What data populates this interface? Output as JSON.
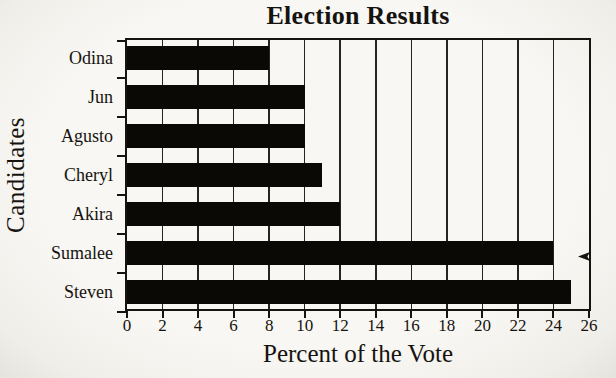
{
  "chart_data": {
    "type": "bar",
    "orientation": "horizontal",
    "title": "Election Results",
    "xlabel": "Percent of the Vote",
    "ylabel": "Candidates",
    "categories": [
      "Odina",
      "Jun",
      "Agusto",
      "Cheryl",
      "Akira",
      "Sumalee",
      "Steven"
    ],
    "values": [
      8,
      10,
      10,
      11,
      12,
      24,
      25
    ],
    "xlim": [
      0,
      26
    ],
    "xticks": [
      0,
      2,
      4,
      6,
      8,
      10,
      12,
      14,
      16,
      18,
      20,
      22,
      24,
      26
    ],
    "grid": "vertical gridlines every 2 units",
    "legend": "none",
    "bar_color": "#0a0906",
    "background_color": "#f6f5f1",
    "frame_color": "#16140f",
    "decorations": [
      "left-arrowhead-artifact-on-right-border-at-sumalee-row"
    ]
  }
}
